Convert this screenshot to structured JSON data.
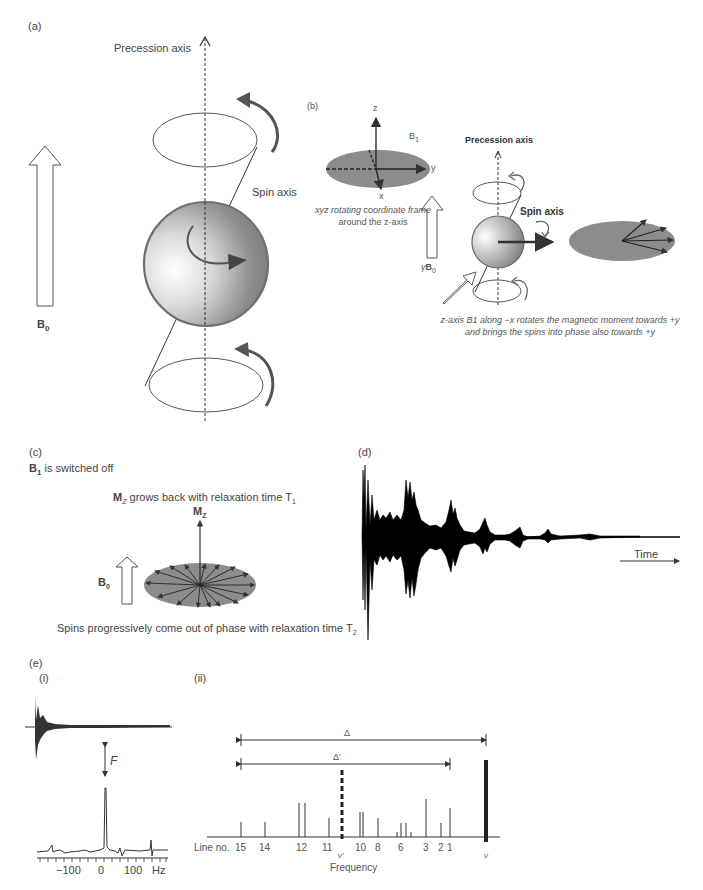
{
  "panels": {
    "a": {
      "label": "(a)",
      "precession_axis": "Precession axis",
      "spin_axis": "Spin axis",
      "field_label": "B",
      "field_sub": "0"
    },
    "b": {
      "label": "(b)",
      "axis_z": "z",
      "axis_y": "y",
      "axis_x": "x",
      "b1_label": "B",
      "b1_sub": "1",
      "frame_caption_1": "xyz rotating coordinate frame",
      "frame_caption_2": "around the z-axis",
      "gamma_b0_prefix": "γ",
      "gamma_b0_label": "B",
      "gamma_b0_sub": "0",
      "precession_axis": "Precession axis",
      "spin_axis": "Spin axis",
      "caption_1": "z-axis B1 along −x rotates the magnetic moment towards +y",
      "caption_2": "and brings the spins into phase also towards +y"
    },
    "c": {
      "label": "(c)",
      "subtitle_b": "B",
      "subtitle_sub": "1",
      "subtitle_rest": " is switched off",
      "mz_caption_b": "M",
      "mz_caption_sub": "Z",
      "mz_caption_rest": " grows back with relaxation time T",
      "mz_caption_t": "1",
      "mz_label": "M",
      "mz_label_sub": "Z",
      "b0_label": "B",
      "b0_sub": "0",
      "dephase_caption": "Spins progressively come out of phase with relaxation time T",
      "dephase_t": "2"
    },
    "d": {
      "label": "(d)",
      "time_label": "Time"
    },
    "e": {
      "label": "(e)",
      "sub_i": "(i)",
      "sub_ii": "(ii)",
      "transform_label": "F",
      "hz_ticks": [
        "−100",
        "0",
        "100",
        "Hz"
      ],
      "delta": "Δ",
      "delta_prime": "Δ′",
      "line_no_label": "Line no.",
      "line_numbers": [
        "15",
        "14",
        "12",
        "11",
        "10",
        "8",
        "6",
        "3",
        "2",
        "1"
      ],
      "nu_prime": "ν′",
      "nu": "ν",
      "frequency_label": "Frequency"
    }
  },
  "colors": {
    "ellipse_fill": "#8c8c8c",
    "stroke": "#333333",
    "sphere_rim": "#777777",
    "text": "#444444"
  }
}
